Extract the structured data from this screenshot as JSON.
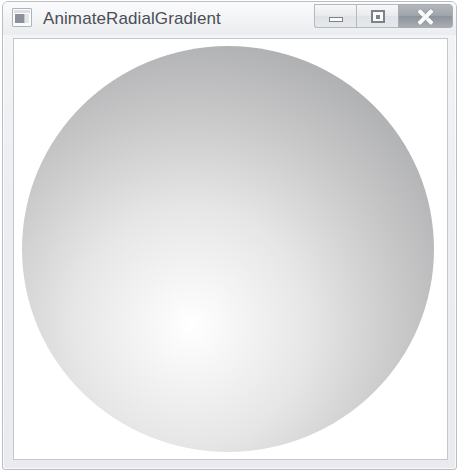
{
  "window": {
    "title": "AnimateRadialGradient",
    "icon": "window-form-icon",
    "controls": {
      "minimize": {
        "label": "Minimize",
        "icon": "minimize-icon"
      },
      "maximize": {
        "label": "Maximize",
        "icon": "maximize-icon"
      },
      "close": {
        "label": "Close",
        "icon": "close-icon"
      }
    },
    "colors": {
      "titlebar_background": "#f2f3f5",
      "frame_border": "#b9bdc4",
      "client_background": "#ffffff",
      "close_button_background": "#9fa4ab",
      "title_text": "#4a4f57"
    }
  },
  "client": {
    "shape": {
      "name": "radial-gradient-ellipse",
      "type": "ellipse",
      "gradient_type": "radial",
      "gradient_center": "41% 69%",
      "gradient_origin": "41% 69%",
      "stops": [
        {
          "offset": "0%",
          "color": "#ffffff"
        },
        {
          "offset": "32%",
          "color": "#e6e6e6"
        },
        {
          "offset": "58%",
          "color": "#c7c7c8"
        },
        {
          "offset": "83%",
          "color": "#aaabad"
        },
        {
          "offset": "100%",
          "color": "#9c9da0"
        }
      ]
    }
  }
}
